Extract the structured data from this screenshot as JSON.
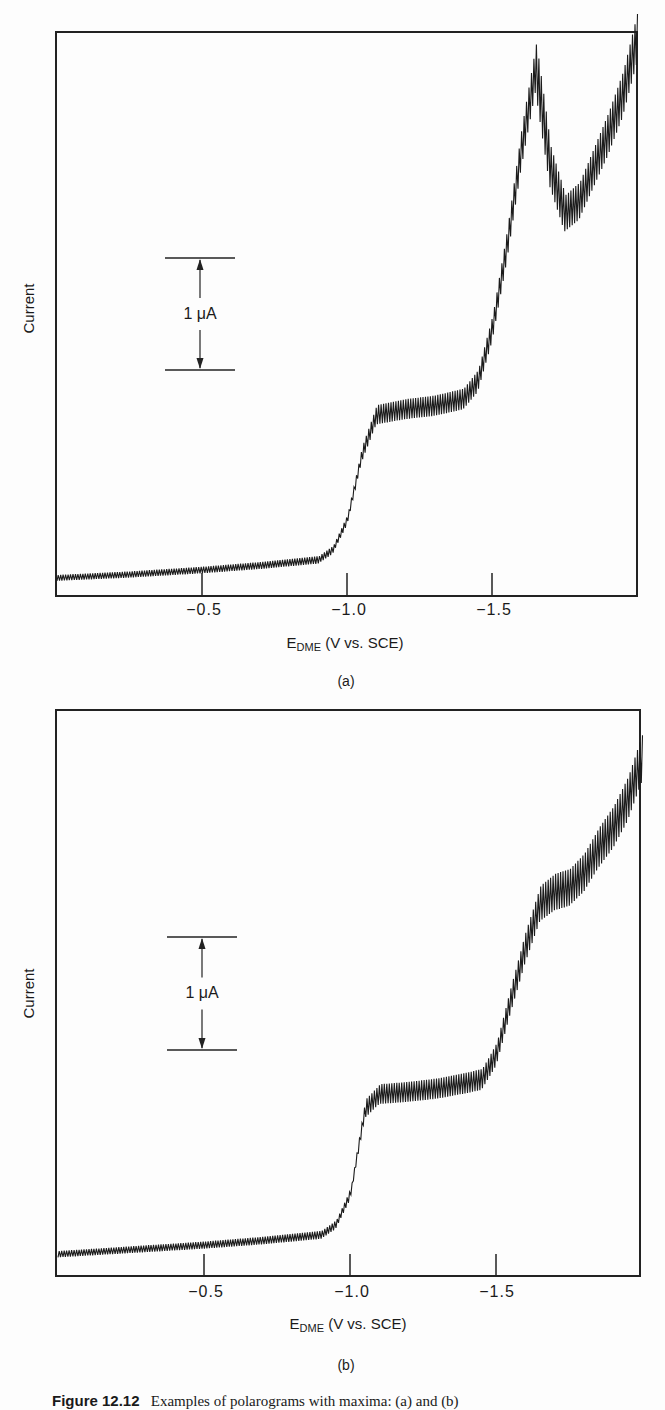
{
  "chart_data": [
    {
      "type": "line",
      "panel_label": "(a)",
      "title": "",
      "xlabel": "E_DME (V vs. SCE)",
      "xlabel_main": "E",
      "xlabel_sub": "DME",
      "xlabel_rest": " (V vs. SCE)",
      "ylabel": "Current",
      "xlim": [
        0.0,
        -2.0
      ],
      "x_ticks": [
        -0.5,
        -1.0,
        -1.5
      ],
      "x_tick_labels": [
        "−0.5",
        "−1.0",
        "−1.5"
      ],
      "scale_bar": "1 μA",
      "grid": false,
      "series": [
        {
          "name": "polarogram (a)",
          "x": [
            0.0,
            -0.25,
            -0.5,
            -0.7,
            -0.9,
            -0.95,
            -1.0,
            -1.05,
            -1.1,
            -1.2,
            -1.3,
            -1.4,
            -1.45,
            -1.5,
            -1.55,
            -1.6,
            -1.65,
            -1.7,
            -1.75,
            -1.8,
            -1.85,
            -1.9,
            -1.95,
            -2.0
          ],
          "y_uA": [
            0.15,
            0.18,
            0.22,
            0.26,
            0.31,
            0.4,
            0.67,
            1.25,
            1.6,
            1.65,
            1.68,
            1.74,
            1.9,
            2.37,
            3.1,
            3.97,
            4.69,
            3.8,
            3.39,
            3.5,
            3.8,
            4.1,
            4.45,
            4.96
          ]
        }
      ]
    },
    {
      "type": "line",
      "panel_label": "(b)",
      "title": "",
      "xlabel": "E_DME (V vs. SCE)",
      "xlabel_main": "E",
      "xlabel_sub": "DME",
      "xlabel_rest": " (V vs. SCE)",
      "ylabel": "Current",
      "xlim": [
        0.0,
        -2.0
      ],
      "x_ticks": [
        -0.5,
        -1.0,
        -1.5
      ],
      "x_tick_labels": [
        "−0.5",
        "−1.0",
        "−1.5"
      ],
      "scale_bar": "1 μA",
      "grid": false,
      "series": [
        {
          "name": "polarogram (b)",
          "x": [
            0.0,
            -0.25,
            -0.5,
            -0.7,
            -0.9,
            -0.95,
            -1.0,
            -1.05,
            -1.1,
            -1.2,
            -1.3,
            -1.4,
            -1.45,
            -1.5,
            -1.55,
            -1.6,
            -1.65,
            -1.7,
            -1.75,
            -1.8,
            -1.85,
            -1.9,
            -1.95,
            -2.0
          ],
          "y_uA": [
            0.19,
            0.23,
            0.27,
            0.31,
            0.36,
            0.45,
            0.72,
            1.47,
            1.6,
            1.62,
            1.65,
            1.7,
            1.73,
            1.95,
            2.44,
            2.9,
            3.28,
            3.38,
            3.42,
            3.55,
            3.77,
            3.95,
            4.2,
            4.57
          ]
        }
      ]
    }
  ],
  "caption": {
    "label": "Figure 12.12",
    "text": "Examples of polarograms with maxima: (a) and (b)"
  }
}
